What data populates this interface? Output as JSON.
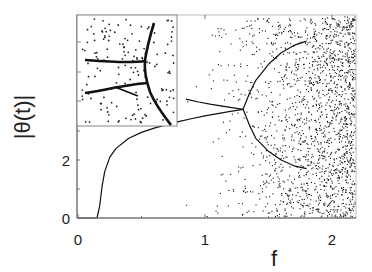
{
  "chart_data": {
    "type": "scatter",
    "title": "",
    "xlabel": "f",
    "ylabel": "|θ(t)|",
    "xlim": [
      0,
      2.19
    ],
    "ylim": [
      0,
      7.0
    ],
    "x_ticks": [
      {
        "value": 0,
        "label": "0"
      },
      {
        "value": 1,
        "label": "1"
      },
      {
        "value": 2,
        "label": "2"
      }
    ],
    "y_ticks": [
      {
        "value": 0,
        "label": "0"
      },
      {
        "value": 2,
        "label": "2"
      }
    ],
    "grid": false,
    "legend": null,
    "series": [
      {
        "name": "stable branch",
        "kind": "line",
        "x": [
          0,
          0.15,
          0.17,
          0.19,
          0.21,
          0.25,
          0.3,
          0.4,
          0.5,
          0.6,
          0.7,
          0.8,
          0.9,
          1.0,
          1.1,
          1.2,
          1.3
        ],
        "y": [
          0,
          0,
          0.4,
          1.1,
          1.6,
          2.1,
          2.4,
          2.75,
          2.95,
          3.1,
          3.22,
          3.33,
          3.43,
          3.52,
          3.6,
          3.68,
          3.75
        ]
      },
      {
        "name": "upper bifurcation branch",
        "kind": "line",
        "x": [
          1.3,
          1.35,
          1.4,
          1.5,
          1.6,
          1.7,
          1.8
        ],
        "y": [
          3.75,
          4.3,
          4.75,
          5.3,
          5.7,
          5.95,
          6.1
        ]
      },
      {
        "name": "lower bifurcation branch",
        "kind": "line",
        "x": [
          1.3,
          1.35,
          1.4,
          1.5,
          1.6,
          1.7,
          1.8
        ],
        "y": [
          3.75,
          3.2,
          2.75,
          2.3,
          2.0,
          1.8,
          1.7
        ]
      },
      {
        "name": "unstable branch",
        "kind": "line",
        "x": [
          0.85,
          0.95,
          1.05,
          1.15,
          1.25,
          1.3
        ],
        "y": [
          4.1,
          4.0,
          3.92,
          3.85,
          3.78,
          3.75
        ]
      },
      {
        "name": "chaotic scatter",
        "kind": "scatter",
        "note": "dense random points, density increasing with f from ~0.9 to 2.19"
      }
    ],
    "inset": {
      "description": "zoomed view of bifurcation region",
      "y_ticks": [
        {
          "value": 2,
          "label": ""
        }
      ]
    }
  }
}
